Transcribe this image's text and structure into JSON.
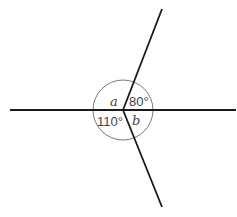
{
  "diagram": {
    "type": "angles-at-a-point",
    "vertex": {
      "x": 123,
      "y": 110
    },
    "lines": [
      {
        "name": "horizontal-line",
        "x1": 10,
        "y1": 110,
        "x2": 236,
        "y2": 110
      },
      {
        "name": "upper-ray",
        "x1": 123,
        "y1": 110,
        "x2": 162,
        "y2": 9
      },
      {
        "name": "lower-ray",
        "x1": 123,
        "y1": 110,
        "x2": 162,
        "y2": 207
      }
    ],
    "circle_radius": 30,
    "labels": {
      "a": "a",
      "b": "b",
      "angle_80": "80°",
      "angle_110": "110°"
    },
    "colors": {
      "line": "#1a1a1a",
      "circle": "#555555",
      "text": "#444444"
    }
  }
}
